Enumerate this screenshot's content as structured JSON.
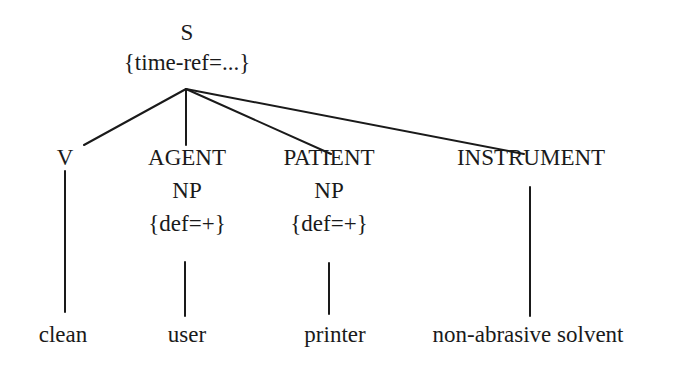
{
  "diagram": {
    "type": "syntax-tree",
    "root": {
      "label": "S",
      "feature": "{time-ref=...}"
    },
    "children": [
      {
        "role": "V",
        "category": "",
        "feature": "",
        "leaf": "clean"
      },
      {
        "role": "AGENT",
        "category": "NP",
        "feature": "{def=+}",
        "leaf": "user"
      },
      {
        "role": "PATIENT",
        "category": "NP",
        "feature": "{def=+}",
        "leaf": "printer"
      },
      {
        "role": "INSTRUMENT",
        "category": "",
        "feature": "",
        "leaf": "non-abrasive solvent"
      }
    ],
    "edges": [
      {
        "from": "S",
        "to": "V"
      },
      {
        "from": "S",
        "to": "AGENT"
      },
      {
        "from": "S",
        "to": "PATIENT"
      },
      {
        "from": "S",
        "to": "INSTRUMENT"
      },
      {
        "from": "V",
        "to": "clean"
      },
      {
        "from": "AGENT",
        "to": "user"
      },
      {
        "from": "PATIENT",
        "to": "printer"
      },
      {
        "from": "INSTRUMENT",
        "to": "non-abrasive solvent"
      }
    ],
    "line_color": "#1a1a1a",
    "background": "#ffffff"
  }
}
